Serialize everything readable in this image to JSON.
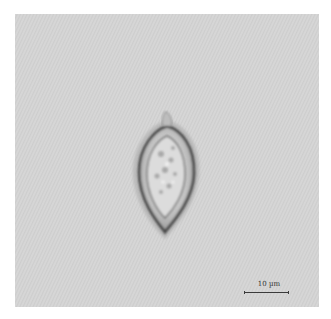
{
  "image": {
    "description": "Brightfield micrograph of a single teardrop/spindle-shaped microorganism (e.g., dinoflagellate or diatom cell) with granular interior against gray background",
    "background_color": "#d4d4d4"
  },
  "scale_bar": {
    "label": "10 µm",
    "color": "#3a3a3a"
  }
}
